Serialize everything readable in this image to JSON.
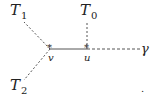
{
  "diagram": {
    "nodes": {
      "v": {
        "label": "v",
        "x": 50,
        "y": 49
      },
      "u": {
        "label": "u",
        "x": 87,
        "y": 49
      }
    },
    "labels": {
      "T1": {
        "base": "T",
        "sub": "1"
      },
      "T0": {
        "base": "T",
        "sub": "0"
      },
      "T2": {
        "base": "T",
        "sub": "2"
      },
      "gamma": {
        "text": "γ"
      }
    },
    "edges": [
      {
        "from": "v",
        "to": "u",
        "style": "solid"
      },
      {
        "from": "v",
        "to": "T1",
        "style": "dashed"
      },
      {
        "from": "v",
        "to": "T2",
        "style": "dashed"
      },
      {
        "from": "u",
        "to": "T0",
        "style": "dashed"
      },
      {
        "from": "u",
        "to": "gamma",
        "style": "dashed"
      }
    ],
    "node_marker": "*",
    "stray_mark": "."
  }
}
